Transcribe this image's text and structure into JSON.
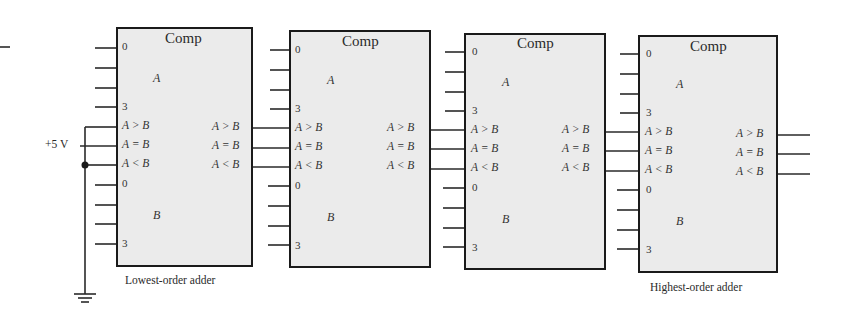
{
  "figure": {
    "supply_label": "+5 V",
    "captions": {
      "lowest": "Lowest-order adder",
      "highest": "Highest-order adder"
    }
  },
  "comparators": [
    {
      "title": "Comp",
      "inputs_a": {
        "first": "0",
        "last": "3",
        "bus": "A"
      },
      "inputs_b": {
        "first": "0",
        "last": "3",
        "bus": "B"
      },
      "cascade_in": [
        "A > B",
        "A = B",
        "A < B"
      ],
      "cascade_out": [
        "A > B",
        "A = B",
        "A < B"
      ]
    },
    {
      "title": "Comp",
      "inputs_a": {
        "first": "0",
        "last": "3",
        "bus": "A"
      },
      "inputs_b": {
        "first": "0",
        "last": "3",
        "bus": "B"
      },
      "cascade_in": [
        "A > B",
        "A = B",
        "A < B"
      ],
      "cascade_out": [
        "A > B",
        "A = B",
        "A < B"
      ]
    },
    {
      "title": "Comp",
      "inputs_a": {
        "first": "0",
        "last": "3",
        "bus": "A"
      },
      "inputs_b": {
        "first": "0",
        "last": "3",
        "bus": "B"
      },
      "cascade_in": [
        "A > B",
        "A = B",
        "A < B"
      ],
      "cascade_out": [
        "A > B",
        "A = B",
        "A < B"
      ]
    },
    {
      "title": "Comp",
      "inputs_a": {
        "first": "0",
        "last": "3",
        "bus": "A"
      },
      "inputs_b": {
        "first": "0",
        "last": "3",
        "bus": "B"
      },
      "cascade_in": [
        "A > B",
        "A = B",
        "A < B"
      ],
      "cascade_out": [
        "A > B",
        "A = B",
        "A < B"
      ]
    }
  ]
}
